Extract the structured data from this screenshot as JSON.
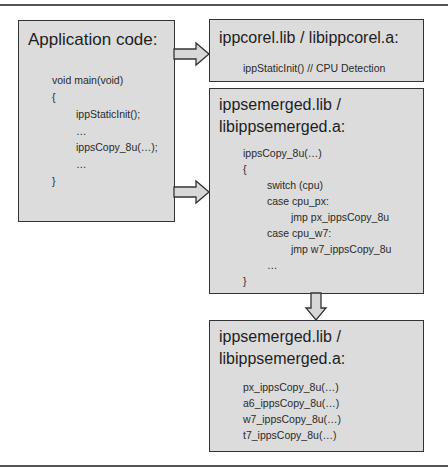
{
  "diagram": {
    "colors": {
      "box_fill": "#dcdcdc",
      "border": "#333333",
      "arrow_fill": "#d8d8d8",
      "rule": "#555555"
    },
    "app_box": {
      "title": "Application code:",
      "lines": [
        {
          "indent": 0,
          "text": "void main(void)"
        },
        {
          "indent": 0,
          "text": "{"
        },
        {
          "indent": 1,
          "text": "ippStaticInit();"
        },
        {
          "indent": 1,
          "text": "…"
        },
        {
          "indent": 1,
          "text": "ippsCopy_8u(…);"
        },
        {
          "indent": 1,
          "text": "…"
        },
        {
          "indent": 0,
          "text": "}"
        }
      ]
    },
    "core_box": {
      "title": "ippcorel.lib / libippcorel.a:",
      "lines": [
        {
          "indent": 0,
          "text": "ippStaticInit() // CPU Detection"
        }
      ]
    },
    "merged_box": {
      "title_line1": "ippsemerged.lib /",
      "title_line2": "libippsemerged.a:",
      "lines": [
        {
          "indent": 0,
          "text": "ippsCopy_8u(…)"
        },
        {
          "indent": 0,
          "text": "{"
        },
        {
          "indent": 1,
          "text": "switch (cpu)"
        },
        {
          "indent": 1,
          "text": "case cpu_px:"
        },
        {
          "indent": 2,
          "text": "jmp px_ippsCopy_8u"
        },
        {
          "indent": 1,
          "text": "case cpu_w7:"
        },
        {
          "indent": 2,
          "text": "jmp w7_ippsCopy_8u"
        },
        {
          "indent": 1,
          "text": "…"
        },
        {
          "indent": 0,
          "text": "}"
        }
      ]
    },
    "merged_impl_box": {
      "title_line1": "ippsemerged.lib /",
      "title_line2": "libippsemerged.a:",
      "lines": [
        {
          "indent": 0,
          "text": "px_ippsCopy_8u(…)"
        },
        {
          "indent": 0,
          "text": "a6_ippsCopy_8u(…)"
        },
        {
          "indent": 0,
          "text": "w7_ippsCopy_8u(…)"
        },
        {
          "indent": 0,
          "text": "t7_ippsCopy_8u(…)"
        }
      ]
    },
    "arrows": [
      {
        "from": "app_box",
        "to": "core_box",
        "direction": "right"
      },
      {
        "from": "app_box",
        "to": "merged_box",
        "direction": "right"
      },
      {
        "from": "merged_box",
        "to": "merged_impl_box",
        "direction": "down"
      }
    ]
  }
}
